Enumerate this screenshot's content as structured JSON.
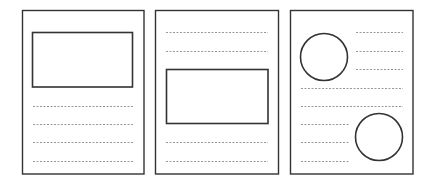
{
  "diagram": {
    "title": "",
    "colors": {
      "frame": "#333333",
      "shape": "#333333",
      "line": "#999999",
      "background": "#ffffff"
    },
    "pages": [
      {
        "id": "layout-image-top",
        "frame": {
          "x": 22.5,
          "y": 10.5,
          "w": 121.5,
          "h": 163.5
        },
        "rects": [
          {
            "x": 32.5,
            "y": 32.5,
            "w": 100,
            "h": 54.5
          }
        ],
        "circles": [],
        "lines": [
          {
            "x1": 33,
            "x2": 133,
            "y": 106
          },
          {
            "x1": 33,
            "x2": 133,
            "y": 124
          },
          {
            "x1": 33,
            "x2": 133,
            "y": 142
          },
          {
            "x1": 33,
            "x2": 133,
            "y": 161
          }
        ]
      },
      {
        "id": "layout-image-middle",
        "frame": {
          "x": 155.5,
          "y": 10.5,
          "w": 123,
          "h": 163.5
        },
        "rects": [
          {
            "x": 166.5,
            "y": 69.5,
            "w": 101.5,
            "h": 54
          }
        ],
        "circles": [],
        "lines": [
          {
            "x1": 166,
            "x2": 268,
            "y": 32
          },
          {
            "x1": 166,
            "x2": 268,
            "y": 51
          },
          {
            "x1": 166,
            "x2": 268,
            "y": 142
          },
          {
            "x1": 166,
            "x2": 268,
            "y": 161
          }
        ]
      },
      {
        "id": "layout-circles",
        "frame": {
          "x": 290.5,
          "y": 10.5,
          "w": 122.5,
          "h": 163.5
        },
        "rects": [],
        "circles": [
          {
            "cx": 324,
            "cy": 57,
            "r": 23.5
          },
          {
            "cx": 379,
            "cy": 137,
            "r": 23.5
          }
        ],
        "lines": [
          {
            "x1": 356,
            "x2": 403,
            "y": 32
          },
          {
            "x1": 356,
            "x2": 403,
            "y": 51
          },
          {
            "x1": 356,
            "x2": 403,
            "y": 69
          },
          {
            "x1": 301,
            "x2": 403,
            "y": 88
          },
          {
            "x1": 301,
            "x2": 403,
            "y": 106
          },
          {
            "x1": 301,
            "x2": 349,
            "y": 124
          },
          {
            "x1": 301,
            "x2": 349,
            "y": 142
          },
          {
            "x1": 301,
            "x2": 349,
            "y": 161
          }
        ]
      }
    ]
  }
}
